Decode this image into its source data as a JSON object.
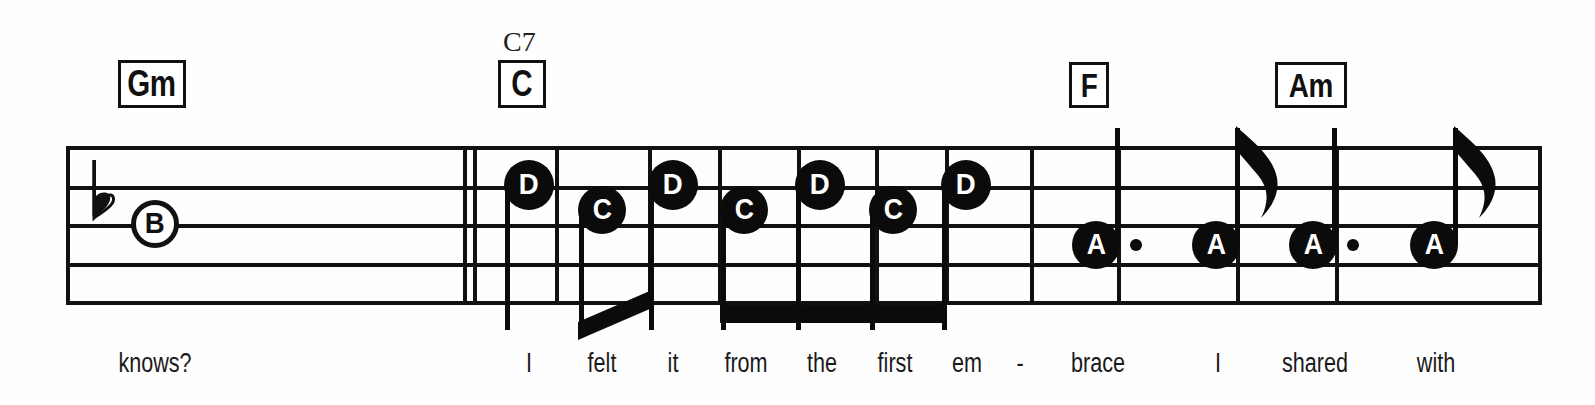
{
  "document": {
    "type": "music-notation-staff",
    "title": "Lead sheet excerpt",
    "background_color": "#ffffff",
    "ink_color": "#111111"
  },
  "staff": {
    "line_count": 5,
    "left_x": 66,
    "right_x": 1540,
    "line_y": [
      146,
      186,
      224,
      263,
      301
    ],
    "barlines": [
      {
        "name": "staff-start-barline",
        "x": 66
      },
      {
        "name": "measure-1-end-barline-a",
        "x": 463
      },
      {
        "name": "measure-1-end-barline-b",
        "x": 473
      },
      {
        "name": "beat-divider-1",
        "x": 555
      },
      {
        "name": "beat-divider-2",
        "x": 648
      },
      {
        "name": "beat-divider-3",
        "x": 718
      },
      {
        "name": "beat-divider-4",
        "x": 797
      },
      {
        "name": "beat-divider-5",
        "x": 875
      },
      {
        "name": "beat-divider-6",
        "x": 945
      },
      {
        "name": "measure-2-end-barline",
        "x": 1030
      },
      {
        "name": "beat-divider-7",
        "x": 1117
      },
      {
        "name": "beat-divider-8",
        "x": 1236
      },
      {
        "name": "beat-divider-9",
        "x": 1335
      },
      {
        "name": "staff-end-barline",
        "x": 1538
      }
    ]
  },
  "accidentals": [
    {
      "name": "flat-accidental",
      "symbol": "♭",
      "x": 96,
      "y": 196
    }
  ],
  "chords": [
    {
      "name": "chord-gm",
      "label": "Gm",
      "alt_label": "",
      "x": 118,
      "y": 60,
      "w": 68,
      "h": 48,
      "font_size": 36
    },
    {
      "name": "chord-c",
      "label": "C",
      "alt_label": "C7",
      "x": 498,
      "y": 60,
      "w": 48,
      "h": 48,
      "font_size": 36,
      "alt_x": 503,
      "alt_y": 28
    },
    {
      "name": "chord-f",
      "label": "F",
      "alt_label": "",
      "x": 1069,
      "y": 62,
      "w": 40,
      "h": 46,
      "font_size": 34
    },
    {
      "name": "chord-am",
      "label": "Am",
      "alt_label": "",
      "x": 1275,
      "y": 62,
      "w": 72,
      "h": 46,
      "font_size": 34
    }
  ],
  "notes": [
    {
      "name": "note-b-whole",
      "letter": "B",
      "style": "hollow",
      "x": 155,
      "y": 224,
      "r": 24,
      "font_size": 30,
      "stem": "none",
      "dotted": false
    },
    {
      "name": "note-d-1",
      "letter": "D",
      "style": "filled",
      "x": 529,
      "y": 185,
      "r": 25,
      "font_size": 30,
      "stem": "down",
      "dotted": false
    },
    {
      "name": "note-c-1",
      "letter": "C",
      "style": "filled",
      "x": 602,
      "y": 210,
      "r": 24,
      "font_size": 29,
      "stem": "down",
      "dotted": false
    },
    {
      "name": "note-d-2",
      "letter": "D",
      "style": "filled",
      "x": 673,
      "y": 185,
      "r": 25,
      "font_size": 30,
      "stem": "down",
      "dotted": false
    },
    {
      "name": "note-c-2",
      "letter": "C",
      "style": "filled",
      "x": 744,
      "y": 210,
      "r": 24,
      "font_size": 29,
      "stem": "down",
      "dotted": false
    },
    {
      "name": "note-d-3",
      "letter": "D",
      "style": "filled",
      "x": 820,
      "y": 185,
      "r": 25,
      "font_size": 30,
      "stem": "down",
      "dotted": false
    },
    {
      "name": "note-c-3",
      "letter": "C",
      "style": "filled",
      "x": 893,
      "y": 210,
      "r": 24,
      "font_size": 29,
      "stem": "down",
      "dotted": false
    },
    {
      "name": "note-d-4",
      "letter": "D",
      "style": "filled",
      "x": 966,
      "y": 185,
      "r": 25,
      "font_size": 30,
      "stem": "down",
      "dotted": false
    },
    {
      "name": "note-a-1",
      "letter": "A",
      "style": "filled",
      "x": 1096,
      "y": 245,
      "r": 24,
      "font_size": 29,
      "stem": "up-plain",
      "dotted": true,
      "dot_x": 1136
    },
    {
      "name": "note-a-2",
      "letter": "A",
      "style": "filled",
      "x": 1216,
      "y": 245,
      "r": 24,
      "font_size": 29,
      "stem": "up-flag",
      "dotted": false
    },
    {
      "name": "note-a-3",
      "letter": "A",
      "style": "filled",
      "x": 1313,
      "y": 245,
      "r": 24,
      "font_size": 29,
      "stem": "up-plain",
      "dotted": true,
      "dot_x": 1353
    },
    {
      "name": "note-a-4",
      "letter": "A",
      "style": "filled",
      "x": 1434,
      "y": 245,
      "r": 24,
      "font_size": 29,
      "stem": "up-flag",
      "dotted": false
    }
  ],
  "beams": [
    {
      "name": "beam-slanted-c-d",
      "type": "slant",
      "x1": 578,
      "y1": 322,
      "x2": 652,
      "y2": 290,
      "thickness": 18
    },
    {
      "name": "beam-horizontal-4note",
      "type": "horizontal",
      "x": 720,
      "y": 305,
      "w": 225,
      "h": 18
    }
  ],
  "lyrics": [
    {
      "name": "lyric-knows",
      "text": "knows?",
      "x": 155,
      "y": 350
    },
    {
      "name": "lyric-i-1",
      "text": "I",
      "x": 529,
      "y": 350
    },
    {
      "name": "lyric-felt",
      "text": "felt",
      "x": 602,
      "y": 350
    },
    {
      "name": "lyric-it",
      "text": "it",
      "x": 673,
      "y": 350
    },
    {
      "name": "lyric-from",
      "text": "from",
      "x": 746,
      "y": 350
    },
    {
      "name": "lyric-the",
      "text": "the",
      "x": 822,
      "y": 350
    },
    {
      "name": "lyric-first",
      "text": "first",
      "x": 895,
      "y": 350
    },
    {
      "name": "lyric-em",
      "text": "em",
      "x": 967,
      "y": 350
    },
    {
      "name": "lyric-hyphen",
      "text": "-",
      "x": 1020,
      "y": 350
    },
    {
      "name": "lyric-brace",
      "text": "brace",
      "x": 1098,
      "y": 350
    },
    {
      "name": "lyric-i-2",
      "text": "I",
      "x": 1218,
      "y": 350
    },
    {
      "name": "lyric-shared",
      "text": "shared",
      "x": 1315,
      "y": 350
    },
    {
      "name": "lyric-with",
      "text": "with",
      "x": 1436,
      "y": 350
    }
  ]
}
